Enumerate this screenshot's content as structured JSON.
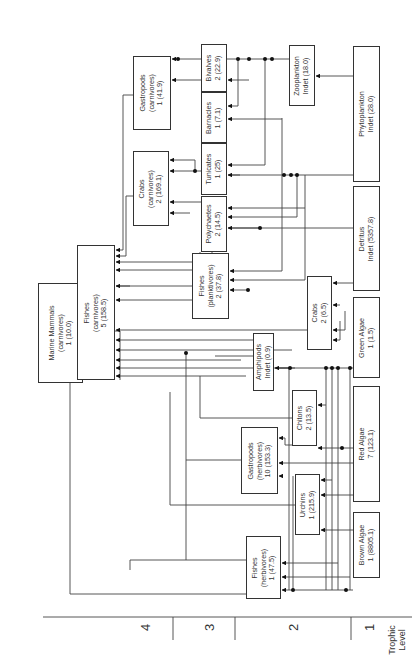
{
  "diagram": {
    "title": "",
    "orientation": "rotated-90-ccw",
    "axis": {
      "title": "Trophic\nLevel",
      "levels": [
        "1",
        "2",
        "3",
        "4"
      ]
    },
    "nodes": [
      {
        "id": "marine_mammals",
        "label": "Marine Mammals\n(carnivores)\n1 (10.0)",
        "x": 38,
        "y": 283,
        "w": 45,
        "h": 100
      },
      {
        "id": "fishes_carn",
        "label": "Fishes\n(carnivores)\n5 (158.5)",
        "x": 77,
        "y": 245,
        "w": 38,
        "h": 135
      },
      {
        "id": "gastropods_carn",
        "label": "Gastropods\n(carnivores)\n1 (41.9)",
        "x": 133,
        "y": 56,
        "w": 38,
        "h": 74
      },
      {
        "id": "crabs_carn",
        "label": "Crabs\n(carnivores)\n2 (169.1)",
        "x": 133,
        "y": 151,
        "w": 36,
        "h": 75
      },
      {
        "id": "bivalves",
        "label": "Bivalves\n2 (22.9)",
        "x": 201,
        "y": 44,
        "w": 26,
        "h": 48
      },
      {
        "id": "barnacles",
        "label": "Barnacles\n1 (7.1)",
        "x": 201,
        "y": 91,
        "w": 26,
        "h": 52
      },
      {
        "id": "tunicates",
        "label": "Tunicates\n1 (25)",
        "x": 201,
        "y": 143,
        "w": 26,
        "h": 52
      },
      {
        "id": "polychaetes",
        "label": "Polychaetes\n2 (14.5)",
        "x": 201,
        "y": 196,
        "w": 26,
        "h": 56
      },
      {
        "id": "fishes_plank",
        "label": "Fishes\n(planktivores)\n2 (37.8)",
        "x": 192,
        "y": 253,
        "w": 37,
        "h": 66
      },
      {
        "id": "zooplankton",
        "label": "Zooplankton\nIndet (18.0)",
        "x": 289,
        "y": 45,
        "w": 26,
        "h": 61
      },
      {
        "id": "phytoplankton",
        "label": "Phytoplankton\nIndet (28.0)",
        "x": 353,
        "y": 46,
        "w": 27,
        "h": 136
      },
      {
        "id": "detritus",
        "label": "Detritus\nIndet (5357.8)",
        "x": 353,
        "y": 186,
        "w": 27,
        "h": 105
      },
      {
        "id": "crabs",
        "label": "Crabs\n2 (6.5)",
        "x": 307,
        "y": 276,
        "w": 25,
        "h": 74
      },
      {
        "id": "green_algae",
        "label": "Green Algae\n1 (1.5)",
        "x": 353,
        "y": 297,
        "w": 27,
        "h": 81
      },
      {
        "id": "amphipods",
        "label": "Amphipods\nIndet (0.9)",
        "x": 253,
        "y": 333,
        "w": 21,
        "h": 58
      },
      {
        "id": "chitons",
        "label": "Chitons\n2 (13.5)",
        "x": 292,
        "y": 390,
        "w": 25,
        "h": 56
      },
      {
        "id": "red_algae",
        "label": "Red Algae\n7 (123.1)",
        "x": 353,
        "y": 386,
        "w": 27,
        "h": 116
      },
      {
        "id": "gastropods_herb",
        "label": "Gastropods\n(herbivores)\n10 (153.3)",
        "x": 241,
        "y": 427,
        "w": 37,
        "h": 67
      },
      {
        "id": "urchins",
        "label": "Urchins\n1 (215.9)",
        "x": 295,
        "y": 474,
        "w": 25,
        "h": 61
      },
      {
        "id": "brown_algae",
        "label": "Brown Algae\n1 (8805.1)",
        "x": 353,
        "y": 512,
        "w": 27,
        "h": 66
      },
      {
        "id": "fishes_herb",
        "label": "Fishes\n(herbivores)\n1 (47.5)",
        "x": 246,
        "y": 536,
        "w": 35,
        "h": 63
      }
    ],
    "edges": [
      [
        "fishes_carn",
        "marine_mammals"
      ],
      [
        "gastropods_carn",
        "fishes_carn"
      ],
      [
        "crabs_carn",
        "fishes_carn"
      ],
      [
        "bivalves",
        "gastropods_carn"
      ],
      [
        "barnacles",
        "gastropods_carn"
      ],
      [
        "tunicates",
        "crabs_carn"
      ],
      [
        "polychaetes",
        "crabs_carn"
      ],
      [
        "zooplankton",
        "bivalves"
      ],
      [
        "zooplankton",
        "barnacles"
      ],
      [
        "phytoplankton",
        "zooplankton"
      ],
      [
        "phytoplankton",
        "tunicates"
      ],
      [
        "detritus",
        "polychaetes"
      ],
      [
        "detritus",
        "crabs"
      ],
      [
        "zooplankton",
        "fishes_plank"
      ],
      [
        "fishes_plank",
        "fishes_carn"
      ],
      [
        "amphipods",
        "fishes_plank"
      ],
      [
        "green_algae",
        "amphipods"
      ],
      [
        "red_algae",
        "chitons"
      ],
      [
        "red_algae",
        "gastropods_herb"
      ],
      [
        "brown_algae",
        "urchins"
      ],
      [
        "brown_algae",
        "fishes_herb"
      ],
      [
        "urchins",
        "fishes_carn"
      ],
      [
        "gastropods_herb",
        "fishes_carn"
      ],
      [
        "chitons",
        "fishes_carn"
      ],
      [
        "fishes_herb",
        "fishes_carn"
      ]
    ]
  }
}
